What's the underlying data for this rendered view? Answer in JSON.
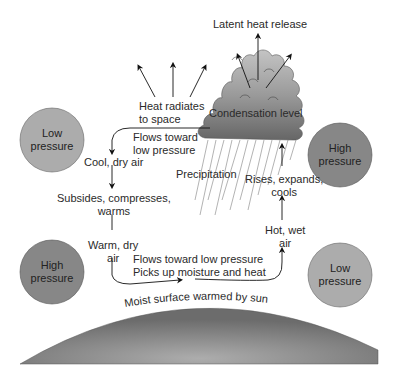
{
  "diagram": {
    "pressure_cells": [
      {
        "id": "top-left",
        "label_line1": "Low",
        "label_line2": "pressure",
        "type": "low",
        "color": "#a9a9a9"
      },
      {
        "id": "top-right",
        "label_line1": "High",
        "label_line2": "pressure",
        "type": "high",
        "color": "#858585"
      },
      {
        "id": "bottom-left",
        "label_line1": "High",
        "label_line2": "pressure",
        "type": "high",
        "color": "#858585"
      },
      {
        "id": "bottom-right",
        "label_line1": "Low",
        "label_line2": "pressure",
        "type": "low",
        "color": "#a9a9a9"
      }
    ],
    "labels": {
      "latent_heat": "Latent heat release",
      "condensation": "Condensation level",
      "heat_radiates_1": "Heat radiates",
      "heat_radiates_2": "to space",
      "flows_toward_1": "Flows toward",
      "flows_toward_2": "low pressure",
      "cool_dry_air": "Cool, dry air",
      "precipitation": "Precipitation",
      "rises_1": "Rises, expands,",
      "rises_2": "cools",
      "subsides_1": "Subsides, compresses,",
      "subsides_2": "warms",
      "hot_wet_1": "Hot, wet",
      "hot_wet_2": "air",
      "warm_dry_1": "Warm, dry",
      "warm_dry_2": "air",
      "surface_flow_1": "Flows toward low pressure",
      "surface_flow_2": "Picks up moisture and heat",
      "surface": "Moist surface warmed by sun"
    },
    "colors": {
      "cloud_dark": "#6a6a6a",
      "cloud_light": "#b5b5b5",
      "ground_dark": "#707070",
      "ground_light": "#a5a5a5",
      "arrow": "#111111",
      "rain": "#9a9a9a"
    }
  }
}
